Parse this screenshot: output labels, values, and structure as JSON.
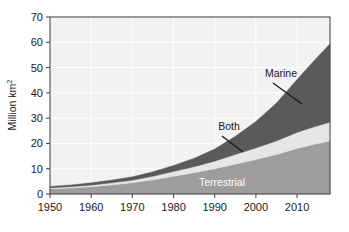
{
  "chart_data": {
    "type": "area",
    "title": "",
    "subtitle": "",
    "xlabel": "",
    "ylabel": "Million km",
    "ylabel_sup": "2",
    "xlim": [
      1950,
      2018
    ],
    "ylim": [
      0,
      70
    ],
    "ytick_labels": [
      "0",
      "10",
      "20",
      "30",
      "40",
      "50",
      "60",
      "70"
    ],
    "ytick_values": [
      0,
      10,
      20,
      30,
      40,
      50,
      60,
      70
    ],
    "xtick_labels": [
      "1950",
      "1960",
      "1970",
      "1980",
      "1990",
      "2000",
      "2010"
    ],
    "xtick_values": [
      1950,
      1960,
      1970,
      1980,
      1990,
      2000,
      2010
    ],
    "grid": true,
    "legend": "in-plot annotations",
    "stacked": true,
    "x": [
      1950,
      1955,
      1960,
      1965,
      1970,
      1975,
      1980,
      1985,
      1990,
      1995,
      2000,
      2005,
      2010,
      2014,
      2018
    ],
    "series": [
      {
        "name": "Terrestrial",
        "color": "#9d9d9d",
        "label_color": "#ffffff",
        "values": [
          2.0,
          2.4,
          2.9,
          3.6,
          4.4,
          5.6,
          7.0,
          8.4,
          10.0,
          11.8,
          13.6,
          15.6,
          18.0,
          19.6,
          21.0
        ]
      },
      {
        "name": "Both",
        "color": "#e6e6e6",
        "label_color": "#1a1a1a",
        "values": [
          0.4,
          0.5,
          0.6,
          0.8,
          1.0,
          1.4,
          1.9,
          2.4,
          3.0,
          3.8,
          4.6,
          5.4,
          6.3,
          6.9,
          7.4
        ]
      },
      {
        "name": "Marine",
        "color": "#5a5a5a",
        "label_color": "#1a1a1a",
        "values": [
          0.6,
          0.7,
          0.9,
          1.1,
          1.4,
          1.8,
          2.4,
          3.3,
          4.8,
          7.2,
          10.5,
          15.0,
          21.0,
          26.0,
          31.0
        ]
      }
    ],
    "totals": [
      3.0,
      3.6,
      4.4,
      5.5,
      6.8,
      8.8,
      11.3,
      14.1,
      17.8,
      22.8,
      28.7,
      36.0,
      45.3,
      52.5,
      59.4
    ],
    "annotations": [
      {
        "text": "Marine",
        "series": "Marine"
      },
      {
        "text": "Both",
        "series": "Both"
      },
      {
        "text": "Terrestrial",
        "series": "Terrestrial"
      }
    ],
    "colors": {
      "plot_background": "#f2f2f2",
      "grid": "#ffffff",
      "frame": "#4d4d4d",
      "text": "#1a1a1a",
      "marine": "#5a5a5a",
      "both": "#e6e6e6",
      "terrestrial": "#9d9d9d"
    }
  }
}
